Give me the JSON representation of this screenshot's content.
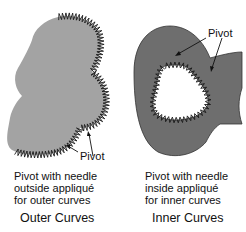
{
  "panels": [
    {
      "id": "outer",
      "heading": "Outer Curves",
      "caption_lines": [
        "Pivot with needle",
        "outside appliqué",
        "for outer curves"
      ],
      "pivot_label": "Pivot",
      "fill_color": "#a3a3a3"
    },
    {
      "id": "inner",
      "heading": "Inner Curves",
      "caption_lines": [
        "Pivot with needle",
        "inside appliqué",
        "for inner curves"
      ],
      "pivot_label": "Pivot",
      "fill_color": "#6e6e6e"
    }
  ],
  "colors": {
    "stitch": "#1a1a1a",
    "background": "#ffffff"
  }
}
